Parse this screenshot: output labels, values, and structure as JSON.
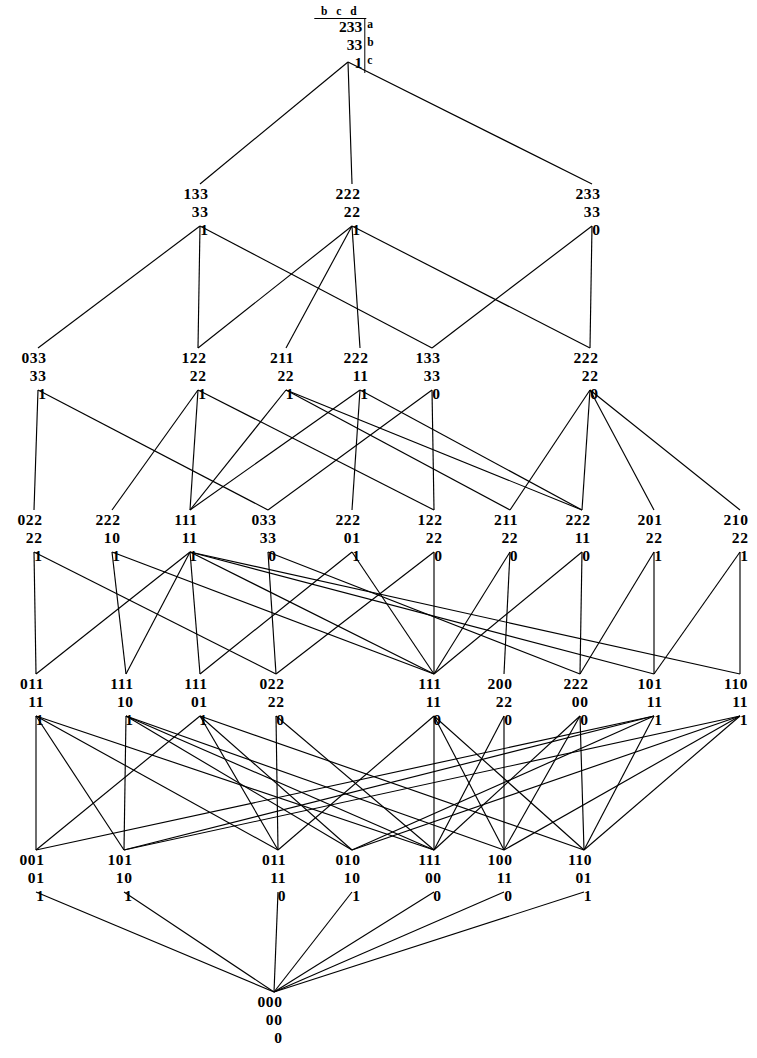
{
  "figure": {
    "kind": "hasse-diagram",
    "header": {
      "columns": "b c d",
      "row_labels": [
        "a",
        "b",
        "c"
      ]
    },
    "stroke_color": "#000000",
    "background_color": "#ffffff",
    "faint_top_text": ""
  },
  "nodes": [
    {
      "id": "n0",
      "level": 0,
      "x": 344,
      "y": 22,
      "rows": [
        "233",
        "33",
        "1"
      ]
    },
    {
      "id": "n1",
      "level": 1,
      "x": 196,
      "y": 186,
      "rows": [
        "133",
        "33",
        "1"
      ]
    },
    {
      "id": "n2",
      "level": 1,
      "x": 348,
      "y": 186,
      "rows": [
        "222",
        "22",
        "1"
      ]
    },
    {
      "id": "n3",
      "level": 1,
      "x": 588,
      "y": 186,
      "rows": [
        "233",
        "33",
        "0"
      ]
    },
    {
      "id": "n4",
      "level": 2,
      "x": 34,
      "y": 350,
      "rows": [
        "033",
        "33",
        "1"
      ]
    },
    {
      "id": "n5",
      "level": 2,
      "x": 194,
      "y": 350,
      "rows": [
        "122",
        "22",
        "1"
      ]
    },
    {
      "id": "n6",
      "level": 2,
      "x": 282,
      "y": 350,
      "rows": [
        "211",
        "22",
        "1"
      ]
    },
    {
      "id": "n7",
      "level": 2,
      "x": 356,
      "y": 350,
      "rows": [
        "222",
        "11",
        "1"
      ]
    },
    {
      "id": "n8",
      "level": 2,
      "x": 428,
      "y": 350,
      "rows": [
        "133",
        "33",
        "0"
      ]
    },
    {
      "id": "n9",
      "level": 2,
      "x": 586,
      "y": 350,
      "rows": [
        "222",
        "22",
        "0"
      ]
    },
    {
      "id": "n10",
      "level": 3,
      "x": 30,
      "y": 512,
      "rows": [
        "022",
        "22",
        "1"
      ]
    },
    {
      "id": "n11",
      "level": 3,
      "x": 108,
      "y": 512,
      "rows": [
        "222",
        "10",
        "1"
      ]
    },
    {
      "id": "n12",
      "level": 3,
      "x": 186,
      "y": 512,
      "rows": [
        "111",
        "11",
        "1"
      ]
    },
    {
      "id": "n13",
      "level": 3,
      "x": 264,
      "y": 512,
      "rows": [
        "033",
        "33",
        "0"
      ]
    },
    {
      "id": "n14",
      "level": 3,
      "x": 348,
      "y": 512,
      "rows": [
        "222",
        "01",
        "1"
      ]
    },
    {
      "id": "n15",
      "level": 3,
      "x": 430,
      "y": 512,
      "rows": [
        "122",
        "22",
        "0"
      ]
    },
    {
      "id": "n16",
      "level": 3,
      "x": 506,
      "y": 512,
      "rows": [
        "211",
        "22",
        "0"
      ]
    },
    {
      "id": "n17",
      "level": 3,
      "x": 578,
      "y": 512,
      "rows": [
        "222",
        "11",
        "0"
      ]
    },
    {
      "id": "n18",
      "level": 3,
      "x": 650,
      "y": 512,
      "rows": [
        "201",
        "22",
        "1"
      ]
    },
    {
      "id": "n19",
      "level": 3,
      "x": 736,
      "y": 512,
      "rows": [
        "210",
        "22",
        "1"
      ]
    },
    {
      "id": "n20",
      "level": 4,
      "x": 32,
      "y": 676,
      "rows": [
        "011",
        "11",
        "1"
      ]
    },
    {
      "id": "n21",
      "level": 4,
      "x": 122,
      "y": 676,
      "rows": [
        "111",
        "10",
        "1"
      ]
    },
    {
      "id": "n22",
      "level": 4,
      "x": 196,
      "y": 676,
      "rows": [
        "111",
        "01",
        "1"
      ]
    },
    {
      "id": "n23",
      "level": 4,
      "x": 272,
      "y": 676,
      "rows": [
        "022",
        "22",
        "0"
      ]
    },
    {
      "id": "n24",
      "level": 4,
      "x": 430,
      "y": 676,
      "rows": [
        "111",
        "11",
        "0"
      ]
    },
    {
      "id": "n25",
      "level": 4,
      "x": 500,
      "y": 676,
      "rows": [
        "200",
        "22",
        "0"
      ]
    },
    {
      "id": "n26",
      "level": 4,
      "x": 576,
      "y": 676,
      "rows": [
        "222",
        "00",
        "0"
      ]
    },
    {
      "id": "n27",
      "level": 4,
      "x": 650,
      "y": 676,
      "rows": [
        "101",
        "11",
        "1"
      ]
    },
    {
      "id": "n28",
      "level": 4,
      "x": 736,
      "y": 676,
      "rows": [
        "110",
        "11",
        "1"
      ]
    },
    {
      "id": "n29",
      "level": 5,
      "x": 32,
      "y": 852,
      "rows": [
        "001",
        "01",
        "1"
      ]
    },
    {
      "id": "n30",
      "level": 5,
      "x": 120,
      "y": 852,
      "rows": [
        "101",
        "10",
        "1"
      ]
    },
    {
      "id": "n31",
      "level": 5,
      "x": 274,
      "y": 852,
      "rows": [
        "011",
        "11",
        "0"
      ]
    },
    {
      "id": "n32",
      "level": 5,
      "x": 348,
      "y": 852,
      "rows": [
        "010",
        "10",
        "1"
      ]
    },
    {
      "id": "n33",
      "level": 5,
      "x": 430,
      "y": 852,
      "rows": [
        "111",
        "00",
        "0"
      ]
    },
    {
      "id": "n34",
      "level": 5,
      "x": 500,
      "y": 852,
      "rows": [
        "100",
        "11",
        "0"
      ]
    },
    {
      "id": "n35",
      "level": 5,
      "x": 580,
      "y": 852,
      "rows": [
        "110",
        "01",
        "1"
      ]
    },
    {
      "id": "n36",
      "level": 6,
      "x": 270,
      "y": 994,
      "rows": [
        "000",
        "00",
        "0"
      ]
    }
  ],
  "edges": [
    [
      "n0",
      "n1"
    ],
    [
      "n0",
      "n2"
    ],
    [
      "n0",
      "n3"
    ],
    [
      "n1",
      "n4"
    ],
    [
      "n1",
      "n5"
    ],
    [
      "n1",
      "n8"
    ],
    [
      "n2",
      "n5"
    ],
    [
      "n2",
      "n6"
    ],
    [
      "n2",
      "n7"
    ],
    [
      "n2",
      "n9"
    ],
    [
      "n3",
      "n8"
    ],
    [
      "n3",
      "n9"
    ],
    [
      "n4",
      "n10"
    ],
    [
      "n4",
      "n13"
    ],
    [
      "n5",
      "n11"
    ],
    [
      "n5",
      "n12"
    ],
    [
      "n5",
      "n15"
    ],
    [
      "n6",
      "n12"
    ],
    [
      "n6",
      "n16"
    ],
    [
      "n6",
      "n17"
    ],
    [
      "n7",
      "n14"
    ],
    [
      "n7",
      "n17"
    ],
    [
      "n7",
      "n12"
    ],
    [
      "n8",
      "n13"
    ],
    [
      "n8",
      "n15"
    ],
    [
      "n9",
      "n16"
    ],
    [
      "n9",
      "n17"
    ],
    [
      "n9",
      "n18"
    ],
    [
      "n9",
      "n19"
    ],
    [
      "n10",
      "n20"
    ],
    [
      "n10",
      "n23"
    ],
    [
      "n11",
      "n21"
    ],
    [
      "n11",
      "n24"
    ],
    [
      "n12",
      "n20"
    ],
    [
      "n12",
      "n21"
    ],
    [
      "n12",
      "n22"
    ],
    [
      "n12",
      "n24"
    ],
    [
      "n12",
      "n27"
    ],
    [
      "n12",
      "n28"
    ],
    [
      "n13",
      "n23"
    ],
    [
      "n13",
      "n26"
    ],
    [
      "n14",
      "n22"
    ],
    [
      "n14",
      "n24"
    ],
    [
      "n15",
      "n23"
    ],
    [
      "n15",
      "n24"
    ],
    [
      "n16",
      "n24"
    ],
    [
      "n16",
      "n25"
    ],
    [
      "n17",
      "n24"
    ],
    [
      "n17",
      "n26"
    ],
    [
      "n18",
      "n26"
    ],
    [
      "n18",
      "n27"
    ],
    [
      "n19",
      "n27"
    ],
    [
      "n19",
      "n28"
    ],
    [
      "n20",
      "n29"
    ],
    [
      "n20",
      "n30"
    ],
    [
      "n20",
      "n31"
    ],
    [
      "n20",
      "n33"
    ],
    [
      "n21",
      "n30"
    ],
    [
      "n21",
      "n32"
    ],
    [
      "n21",
      "n33"
    ],
    [
      "n21",
      "n34"
    ],
    [
      "n22",
      "n29"
    ],
    [
      "n22",
      "n31"
    ],
    [
      "n22",
      "n32"
    ],
    [
      "n22",
      "n35"
    ],
    [
      "n23",
      "n31"
    ],
    [
      "n23",
      "n33"
    ],
    [
      "n24",
      "n31"
    ],
    [
      "n24",
      "n33"
    ],
    [
      "n24",
      "n34"
    ],
    [
      "n24",
      "n35"
    ],
    [
      "n25",
      "n33"
    ],
    [
      "n25",
      "n34"
    ],
    [
      "n26",
      "n33"
    ],
    [
      "n26",
      "n34"
    ],
    [
      "n26",
      "n35"
    ],
    [
      "n27",
      "n29"
    ],
    [
      "n27",
      "n30"
    ],
    [
      "n27",
      "n32"
    ],
    [
      "n27",
      "n35"
    ],
    [
      "n28",
      "n30"
    ],
    [
      "n28",
      "n32"
    ],
    [
      "n28",
      "n34"
    ],
    [
      "n28",
      "n35"
    ],
    [
      "n29",
      "n36"
    ],
    [
      "n30",
      "n36"
    ],
    [
      "n31",
      "n36"
    ],
    [
      "n32",
      "n36"
    ],
    [
      "n33",
      "n36"
    ],
    [
      "n34",
      "n36"
    ],
    [
      "n35",
      "n36"
    ]
  ]
}
